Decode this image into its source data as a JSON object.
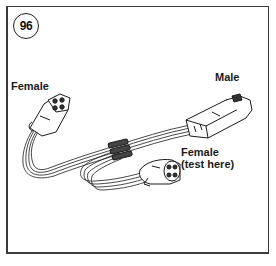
{
  "figure": {
    "number": "96"
  },
  "labels": {
    "female_left": "Female",
    "male": "Male",
    "female_test_line1": "Female",
    "female_test_line2": "(test here)"
  },
  "components": [
    {
      "name": "female-connector-left",
      "type": "female"
    },
    {
      "name": "male-connector",
      "type": "male"
    },
    {
      "name": "female-connector-test",
      "type": "female",
      "note": "test here"
    }
  ],
  "colors": {
    "line": "#1a1a1a",
    "background": "#ffffff",
    "frame": "#3a3a3a"
  }
}
